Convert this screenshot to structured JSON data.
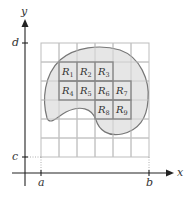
{
  "diagram": {
    "type": "double-integral-region-partition",
    "axes": {
      "x_label": "x",
      "y_label": "y",
      "x_ticks": [
        {
          "label": "a"
        },
        {
          "label": "b"
        }
      ],
      "y_ticks": [
        {
          "label": "c"
        },
        {
          "label": "d"
        }
      ]
    },
    "grid": {
      "columns": 6,
      "rows": 6
    },
    "region": {
      "fill": "#e6e6e6",
      "stroke": "#777777"
    },
    "rectangles": [
      {
        "name": "R",
        "sub": "1"
      },
      {
        "name": "R",
        "sub": "2"
      },
      {
        "name": "R",
        "sub": "3"
      },
      {
        "name": "R",
        "sub": "4"
      },
      {
        "name": "R",
        "sub": "5"
      },
      {
        "name": "R",
        "sub": "6"
      },
      {
        "name": "R",
        "sub": "7"
      },
      {
        "name": "R",
        "sub": "8"
      },
      {
        "name": "R",
        "sub": "9"
      }
    ],
    "colors": {
      "axis": "#222222",
      "grid": "#bdbdbd",
      "rect_stroke": "#888888"
    }
  }
}
